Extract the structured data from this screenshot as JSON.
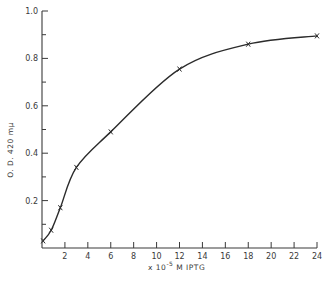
{
  "chart_data": {
    "type": "line",
    "title": "",
    "xlabel": "x 10^-5 M IPTG",
    "xlabel_parts": {
      "prefix": "x 10",
      "exponent": "-5",
      "suffix": " M IPTG"
    },
    "ylabel": "O. D. 420 mμ",
    "xlim": [
      0,
      24
    ],
    "ylim": [
      0,
      1.0
    ],
    "x_ticks": [
      2,
      4,
      6,
      8,
      10,
      12,
      14,
      16,
      18,
      20,
      22,
      24
    ],
    "x_tick_labels": [
      "2",
      "4",
      "6",
      "8",
      "10",
      "12",
      "14",
      "16",
      "18",
      "20",
      "22",
      "24"
    ],
    "y_ticks": [
      0.1,
      0.2,
      0.3,
      0.4,
      0.5,
      0.6,
      0.7,
      0.8,
      0.9,
      1.0
    ],
    "y_tick_labels": [
      "0.2",
      "0.4",
      "0.6",
      "0.8",
      "1.0"
    ],
    "y_labeled_ticks": [
      0.2,
      0.4,
      0.6,
      0.8,
      1.0
    ],
    "grid": false,
    "legend": null,
    "marker": "x",
    "series": [
      {
        "name": "O.D. 420",
        "x": [
          0.1,
          0.8,
          1.6,
          3,
          6,
          12,
          18,
          24
        ],
        "y": [
          0.03,
          0.075,
          0.17,
          0.34,
          0.49,
          0.755,
          0.86,
          0.895
        ]
      }
    ]
  }
}
